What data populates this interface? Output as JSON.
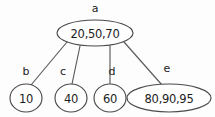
{
  "diagram": {
    "type": "b-tree",
    "title": "",
    "colors": {
      "background": "#fdfdfd",
      "stroke": "#4a4a4a",
      "edge": "#5a5a5a",
      "text": "#1c1c1c",
      "node_fill": "#ffffff"
    },
    "nodes": [
      {
        "id": "a",
        "label": "a",
        "values": "20,50,70",
        "keys": [
          20,
          50,
          70
        ],
        "shape": "ellipse",
        "role": "root",
        "cx": 95,
        "cy": 33,
        "rx": 38,
        "ry": 13,
        "label_x": 95,
        "label_y": 8
      },
      {
        "id": "b",
        "label": "b",
        "values": "10",
        "keys": [
          10
        ],
        "shape": "ellipse",
        "role": "leaf",
        "cx": 26,
        "cy": 98,
        "rx": 16,
        "ry": 14,
        "label_x": 26,
        "label_y": 72
      },
      {
        "id": "c",
        "label": "c",
        "values": "40",
        "keys": [
          40
        ],
        "shape": "ellipse",
        "role": "leaf",
        "cx": 71,
        "cy": 98,
        "rx": 16,
        "ry": 14,
        "label_x": 63,
        "label_y": 72
      },
      {
        "id": "d",
        "label": "d",
        "values": "60",
        "keys": [
          60
        ],
        "shape": "ellipse",
        "role": "leaf",
        "cx": 110,
        "cy": 98,
        "rx": 16,
        "ry": 14,
        "label_x": 112,
        "label_y": 72
      },
      {
        "id": "e",
        "label": "e",
        "values": "80,90,95",
        "keys": [
          80,
          90,
          95
        ],
        "shape": "ellipse",
        "role": "leaf",
        "cx": 169,
        "cy": 98,
        "rx": 42,
        "ry": 14,
        "label_x": 167,
        "label_y": 69
      }
    ],
    "edges": [
      {
        "id": "a-b",
        "from": "a",
        "to": "b",
        "x1": 67,
        "y1": 42,
        "x2": 31,
        "y2": 85
      },
      {
        "id": "a-c",
        "from": "a",
        "to": "c",
        "x1": 80,
        "y1": 46,
        "x2": 72,
        "y2": 84
      },
      {
        "id": "a-d",
        "from": "a",
        "to": "d",
        "x1": 110,
        "y1": 46,
        "x2": 110,
        "y2": 84
      },
      {
        "id": "a-e",
        "from": "a",
        "to": "e",
        "x1": 124,
        "y1": 42,
        "x2": 162,
        "y2": 85
      }
    ]
  }
}
